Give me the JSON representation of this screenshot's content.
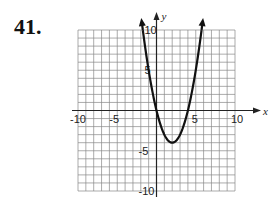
{
  "problem": {
    "number": "41."
  },
  "chart_data": {
    "type": "line",
    "title": "",
    "function": "y = x^2 - 4x",
    "xlabel": "x",
    "ylabel": "y",
    "xlim": [
      -10,
      10
    ],
    "ylim": [
      -10,
      10
    ],
    "grid": true,
    "grid_step": 1,
    "x_tick_labels": [
      "-10",
      "-5",
      "5",
      "10"
    ],
    "y_tick_labels": [
      "10",
      "5",
      "-5",
      "-10"
    ],
    "vertex": [
      2,
      -4
    ],
    "x_intercepts": [
      0,
      4
    ],
    "series": [
      {
        "name": "parabola",
        "x": [
          -1.74,
          -1,
          0,
          1,
          2,
          3,
          4,
          5,
          5.74
        ],
        "y": [
          10,
          5,
          0,
          -3,
          -4,
          -3,
          0,
          5,
          10
        ]
      }
    ],
    "arrows_on_ends": true,
    "colors": {
      "curve": "#111111",
      "grid": "#888888",
      "axis": "#222222"
    }
  }
}
